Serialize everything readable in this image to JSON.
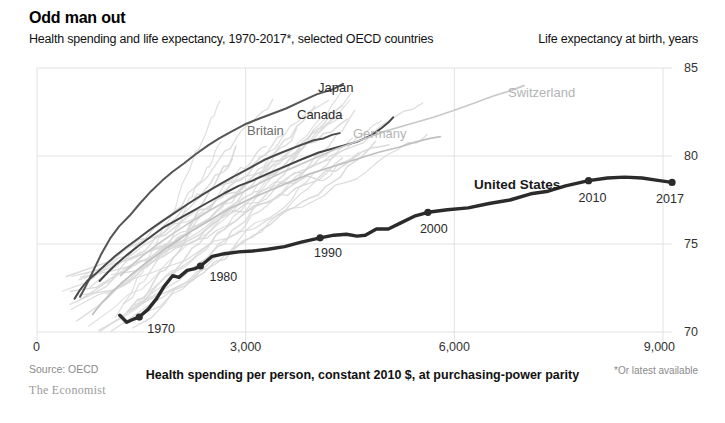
{
  "header": {
    "title": "Odd man out",
    "subtitle": "Health spending and life expectancy, 1970-2017*, selected OECD countries",
    "y_axis_caption": "Life expectancy at birth, years"
  },
  "footer": {
    "source": "Source: OECD",
    "brand": "The Economist",
    "footnote": "*Or latest available",
    "x_axis_caption": "Health spending per person, constant 2010 $, at purchasing-power parity"
  },
  "colors": {
    "us_line": "#2b2b2b",
    "highlight_dark": "#555555",
    "highlight_mid": "#888888",
    "background_lines": "#d8d8d8",
    "grid": "#e2e2e2",
    "text": "#111111",
    "muted_text": "#8a8a8a"
  },
  "chart_data": {
    "type": "line",
    "title": "Odd man out",
    "subtitle": "Health spending and life expectancy, 1970-2017*, selected OECD countries",
    "xlabel": "Health spending per person, constant 2010 $, at purchasing-power parity",
    "ylabel": "Life expectancy at birth, years",
    "xlim": [
      0,
      9000
    ],
    "ylim": [
      70,
      85
    ],
    "xticks": [
      "0",
      "3,000",
      "6,000",
      "9,000"
    ],
    "xtick_values": [
      0,
      3000,
      6000,
      9000
    ],
    "yticks": [
      "85",
      "80",
      "75",
      "70"
    ],
    "ytick_values": [
      85,
      80,
      75,
      70
    ],
    "grid": true,
    "legend": "inline-labels",
    "annotations": [
      {
        "label": "1970",
        "x": 1470,
        "y": 70.85
      },
      {
        "label": "1980",
        "x": 2350,
        "y": 73.75
      },
      {
        "label": "1990",
        "x": 4070,
        "y": 75.35
      },
      {
        "label": "2000",
        "x": 5620,
        "y": 76.8
      },
      {
        "label": "2010",
        "x": 7930,
        "y": 78.6
      },
      {
        "label": "2017",
        "x": 9130,
        "y": 78.5
      }
    ],
    "series": [
      {
        "name": "United States",
        "emphasis": "primary",
        "color": "#2b2b2b",
        "points": [
          [
            1190,
            70.95
          ],
          [
            1290,
            70.55
          ],
          [
            1400,
            70.75
          ],
          [
            1470,
            70.85
          ],
          [
            1600,
            71.3
          ],
          [
            1720,
            71.9
          ],
          [
            1830,
            72.6
          ],
          [
            1950,
            73.2
          ],
          [
            2040,
            73.1
          ],
          [
            2160,
            73.5
          ],
          [
            2270,
            73.6
          ],
          [
            2350,
            73.75
          ],
          [
            2520,
            74.3
          ],
          [
            2700,
            74.45
          ],
          [
            2900,
            74.55
          ],
          [
            3100,
            74.6
          ],
          [
            3320,
            74.7
          ],
          [
            3560,
            74.85
          ],
          [
            3800,
            75.1
          ],
          [
            4070,
            75.35
          ],
          [
            4270,
            75.5
          ],
          [
            4450,
            75.55
          ],
          [
            4600,
            75.45
          ],
          [
            4720,
            75.5
          ],
          [
            4880,
            75.85
          ],
          [
            5050,
            75.85
          ],
          [
            5230,
            76.2
          ],
          [
            5440,
            76.6
          ],
          [
            5620,
            76.8
          ],
          [
            5900,
            76.95
          ],
          [
            6200,
            77.05
          ],
          [
            6500,
            77.3
          ],
          [
            6800,
            77.5
          ],
          [
            7100,
            77.85
          ],
          [
            7350,
            78.0
          ],
          [
            7600,
            78.3
          ],
          [
            7930,
            78.6
          ],
          [
            8200,
            78.75
          ],
          [
            8450,
            78.8
          ],
          [
            8700,
            78.75
          ],
          [
            8950,
            78.6
          ],
          [
            9130,
            78.5
          ]
        ]
      },
      {
        "name": "Japan",
        "emphasis": "secondary",
        "color": "#555555",
        "points": [
          [
            620,
            72.0
          ],
          [
            700,
            72.6
          ],
          [
            800,
            73.4
          ],
          [
            920,
            74.4
          ],
          [
            1050,
            75.3
          ],
          [
            1180,
            76.0
          ],
          [
            1330,
            76.6
          ],
          [
            1480,
            77.3
          ],
          [
            1640,
            78.0
          ],
          [
            1800,
            78.6
          ],
          [
            1950,
            79.1
          ],
          [
            2120,
            79.6
          ],
          [
            2280,
            80.1
          ],
          [
            2460,
            80.6
          ],
          [
            2620,
            81.0
          ],
          [
            2800,
            81.4
          ],
          [
            2990,
            81.8
          ],
          [
            3180,
            82.1
          ],
          [
            3380,
            82.4
          ],
          [
            3580,
            82.7
          ],
          [
            3800,
            83.1
          ],
          [
            4020,
            83.5
          ],
          [
            4260,
            83.8
          ],
          [
            4400,
            84.1
          ]
        ]
      },
      {
        "name": "Canada",
        "emphasis": "secondary",
        "color": "#444444",
        "points": [
          [
            900,
            72.9
          ],
          [
            1020,
            73.4
          ],
          [
            1150,
            73.9
          ],
          [
            1300,
            74.4
          ],
          [
            1460,
            74.9
          ],
          [
            1630,
            75.4
          ],
          [
            1800,
            75.9
          ],
          [
            1980,
            76.3
          ],
          [
            2160,
            76.7
          ],
          [
            2340,
            77.1
          ],
          [
            2520,
            77.5
          ],
          [
            2700,
            77.9
          ],
          [
            2900,
            78.3
          ],
          [
            3100,
            78.6
          ],
          [
            3320,
            79.0
          ],
          [
            3560,
            79.4
          ],
          [
            3800,
            79.8
          ],
          [
            4050,
            80.2
          ],
          [
            4320,
            80.5
          ],
          [
            4600,
            80.8
          ],
          [
            4820,
            81.2
          ],
          [
            4960,
            81.6
          ],
          [
            5050,
            81.9
          ],
          [
            5120,
            82.2
          ]
        ]
      },
      {
        "name": "Britain",
        "emphasis": "secondary",
        "color": "#4a4a4a",
        "points": [
          [
            540,
            71.9
          ],
          [
            620,
            72.4
          ],
          [
            720,
            72.9
          ],
          [
            840,
            73.3
          ],
          [
            980,
            73.8
          ],
          [
            1120,
            74.3
          ],
          [
            1280,
            74.8
          ],
          [
            1450,
            75.3
          ],
          [
            1620,
            75.8
          ],
          [
            1800,
            76.3
          ],
          [
            1990,
            76.8
          ],
          [
            2180,
            77.3
          ],
          [
            2380,
            77.8
          ],
          [
            2590,
            78.3
          ],
          [
            2810,
            78.8
          ],
          [
            3050,
            79.3
          ],
          [
            3280,
            79.8
          ],
          [
            3520,
            80.2
          ],
          [
            3780,
            80.6
          ],
          [
            3980,
            80.9
          ],
          [
            4120,
            81.0
          ],
          [
            4240,
            81.2
          ],
          [
            4350,
            81.3
          ]
        ]
      },
      {
        "name": "Germany",
        "emphasis": "tertiary",
        "color": "#c0c0c0",
        "points": [
          [
            800,
            71.0
          ],
          [
            920,
            71.6
          ],
          [
            1060,
            72.2
          ],
          [
            1220,
            72.8
          ],
          [
            1400,
            73.4
          ],
          [
            1590,
            74.0
          ],
          [
            1800,
            74.6
          ],
          [
            2020,
            75.2
          ],
          [
            2250,
            75.8
          ],
          [
            2500,
            76.4
          ],
          [
            2760,
            77.0
          ],
          [
            3030,
            77.5
          ],
          [
            3320,
            78.0
          ],
          [
            3620,
            78.5
          ],
          [
            3930,
            79.0
          ],
          [
            4250,
            79.4
          ],
          [
            4580,
            79.8
          ],
          [
            4900,
            80.2
          ],
          [
            5200,
            80.5
          ],
          [
            5450,
            80.8
          ],
          [
            5650,
            81.0
          ],
          [
            5800,
            81.1
          ]
        ]
      },
      {
        "name": "Switzerland",
        "emphasis": "tertiary",
        "color": "#c8c8c8",
        "points": [
          [
            1200,
            73.2
          ],
          [
            1360,
            73.8
          ],
          [
            1540,
            74.4
          ],
          [
            1740,
            75.0
          ],
          [
            1960,
            75.6
          ],
          [
            2190,
            76.2
          ],
          [
            2440,
            76.8
          ],
          [
            2700,
            77.4
          ],
          [
            2980,
            78.0
          ],
          [
            3280,
            78.6
          ],
          [
            3600,
            79.2
          ],
          [
            3950,
            79.8
          ],
          [
            4300,
            80.4
          ],
          [
            4650,
            80.9
          ],
          [
            5000,
            81.4
          ],
          [
            5350,
            81.8
          ],
          [
            5700,
            82.2
          ],
          [
            6000,
            82.6
          ],
          [
            6280,
            83.0
          ],
          [
            6550,
            83.4
          ],
          [
            6800,
            83.7
          ],
          [
            7000,
            84.0
          ]
        ]
      }
    ],
    "background_series_count": 28
  },
  "labels": {
    "japan": "Japan",
    "canada": "Canada",
    "britain": "Britain",
    "germany": "Germany",
    "switzerland": "Switzerland",
    "united_states": "United States"
  }
}
